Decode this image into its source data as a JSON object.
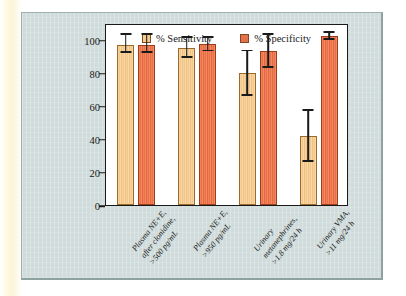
{
  "figure": {
    "panel_background": "#cfdcdb",
    "plot_background": "#ffffff"
  },
  "chart_data": {
    "type": "bar",
    "title": "",
    "subtitle": "",
    "xlabel": "",
    "ylabel": "",
    "ylim": [
      0,
      110
    ],
    "yticks": [
      0,
      20,
      40,
      60,
      80,
      100
    ],
    "ytick_labels": [
      "0",
      "20",
      "40",
      "60",
      "80",
      "100"
    ],
    "grid": false,
    "legend_position": "top-center",
    "categories": [
      "Plasma NE+E, after clonidine, >500 pg/mL",
      "Plasma NE+E, >950 pg/mL",
      "Urinary metanephrines, >1.8 mg/24 h",
      "Urinary VMA, >11 mg/24 h"
    ],
    "category_lines": [
      [
        "Plasma NE+E,",
        "after clonidine,",
        ">500 pg/mL"
      ],
      [
        "Plasma NE+E,",
        ">950 pg/mL"
      ],
      [
        "Urinary",
        "metanephrines,",
        ">1.8 mg/24 h"
      ],
      [
        "Urinary VMA,",
        ">11 mg/24 h"
      ]
    ],
    "series": [
      {
        "name": "% Sensitivity",
        "color": "#f5cd93",
        "values": [
          97,
          95,
          80,
          42
        ],
        "err_low": [
          92,
          89,
          66,
          26
        ],
        "err_high": [
          103,
          101,
          93,
          57
        ]
      },
      {
        "name": "% Specificity",
        "color": "#e4714b",
        "values": [
          97,
          97.5,
          93,
          102
        ],
        "err_low": [
          92,
          93,
          83,
          100
        ],
        "err_high": [
          103,
          101,
          103,
          104
        ]
      }
    ]
  },
  "legend": {
    "items": [
      {
        "label": "% Sensitivity",
        "color": "#f5cd93"
      },
      {
        "label": "% Specificity",
        "color": "#e4714b"
      }
    ]
  }
}
